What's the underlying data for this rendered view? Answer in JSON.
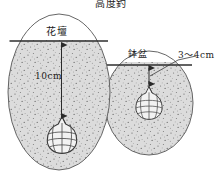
{
  "figure": {
    "title": "高度釣",
    "background_color": "#ffffff",
    "soil_fill_color": "#d8d8d8",
    "air_fill_color": "#ffffff",
    "outline_color": "#4a4a4a",
    "stipple_color": "#6b6b6b",
    "text_color": "#1a1a1a"
  },
  "left_planting": {
    "label": "花壇",
    "depth_label": "10cm",
    "bulb_name": "flower-bulb",
    "shape": "oval"
  },
  "right_planting": {
    "label": "鉢盆",
    "depth_label": "3〜4cm",
    "bulb_name": "flower-bulb",
    "shape": "circle"
  }
}
